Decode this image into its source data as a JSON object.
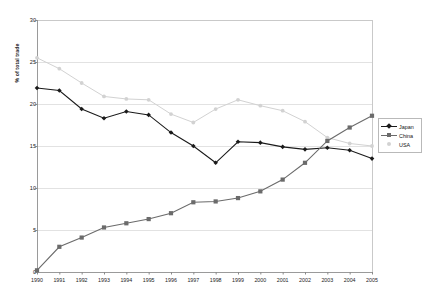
{
  "chart_data": {
    "type": "line",
    "title": "",
    "subtitle": "",
    "xlabel": "",
    "ylabel": "% of total trade",
    "xlim": [
      1990,
      2005
    ],
    "ylim": [
      0,
      30
    ],
    "ytick_values": [
      0,
      5,
      10,
      15,
      20,
      25,
      30
    ],
    "ytick_labels": [
      "0",
      "5",
      "10",
      "15",
      "20",
      "25",
      "30"
    ],
    "grid": true,
    "grid_axis": "y",
    "legend_position": "right",
    "categories": [
      "1990",
      "1991",
      "1992",
      "1993",
      "1994",
      "1995",
      "1996",
      "1997",
      "1998",
      "1999",
      "2000",
      "2001",
      "2002",
      "2003",
      "2004",
      "2005"
    ],
    "x": [
      1990,
      1991,
      1992,
      1993,
      1994,
      1995,
      1996,
      1997,
      1998,
      1999,
      2000,
      2001,
      2002,
      2003,
      2004,
      2005
    ],
    "series": [
      {
        "name": "Japan",
        "marker": "diamond",
        "color": "#1a1a1a",
        "values": [
          21.9,
          21.6,
          19.4,
          18.3,
          19.1,
          18.7,
          16.6,
          15.0,
          13.0,
          15.5,
          15.4,
          14.9,
          14.6,
          14.8,
          14.5,
          13.5
        ]
      },
      {
        "name": "China",
        "marker": "square",
        "color": "#6b6b6b",
        "values": [
          0.2,
          3.0,
          4.1,
          5.3,
          5.8,
          6.3,
          7.0,
          8.3,
          8.4,
          8.8,
          9.6,
          11.0,
          13.0,
          15.6,
          17.2,
          18.6
        ]
      },
      {
        "name": "USA",
        "marker": "dot",
        "color": "#d2d2d2",
        "values": [
          25.5,
          24.2,
          22.5,
          20.9,
          20.6,
          20.5,
          18.8,
          17.8,
          19.4,
          20.5,
          19.8,
          19.2,
          17.9,
          16.0,
          15.3,
          15.0
        ]
      }
    ]
  },
  "legend": {
    "items": [
      {
        "label": "Japan"
      },
      {
        "label": "China"
      },
      {
        "label": "USA"
      }
    ]
  }
}
